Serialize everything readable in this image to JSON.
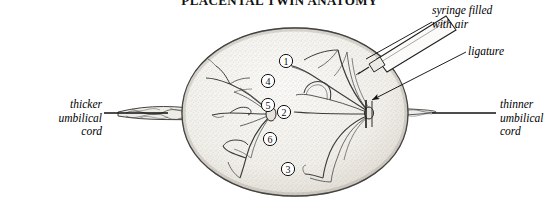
{
  "figure": {
    "title": "PLACENTAL TWIN ANATOMY",
    "alt": "Diagram of a monochorionic twin placenta injected with air through a syringe"
  },
  "labels": {
    "thicker_cord": "thicker\numbilical\ncord",
    "thinner_cord": "thinner\numbilical\ncord",
    "syringe": "syringe filled\nwith air",
    "ligature": "ligature"
  },
  "markers": [
    {
      "id": "1",
      "text": "1",
      "cx": 286,
      "cy": 61
    },
    {
      "id": "2",
      "text": "2",
      "cx": 284,
      "cy": 112
    },
    {
      "id": "3",
      "text": "3",
      "cx": 288,
      "cy": 169
    },
    {
      "id": "4",
      "text": "4",
      "cx": 268,
      "cy": 81
    },
    {
      "id": "5",
      "text": "5",
      "cx": 268,
      "cy": 105
    },
    {
      "id": "6",
      "text": "6",
      "cx": 270,
      "cy": 139
    }
  ],
  "colors": {
    "ink": "#111111",
    "line": "#2a2a2a",
    "vessel": "#3a3a3a",
    "placenta_fill": "#f4f2ee",
    "placenta_rim": "#cfcac2",
    "stipple": "#8d8madd",
    "background": "#ffffff"
  },
  "geometry": {
    "placenta_center_x": 295,
    "placenta_center_y": 113,
    "placenta_radius_x": 113,
    "placenta_radius_y": 85,
    "left_cord_label_rule": {
      "x1": 104,
      "y1": 113,
      "x2": 168,
      "y2": 113
    },
    "right_cord_label_rule": {
      "x1": 432,
      "y1": 113,
      "x2": 496,
      "y2": 113
    },
    "syringe_leader": {
      "x1": 432,
      "y1": 22,
      "x2": 366,
      "y2": 59
    },
    "ligature_leader": {
      "x1": 466,
      "y1": 52,
      "x2": 370,
      "y2": 99
    }
  }
}
